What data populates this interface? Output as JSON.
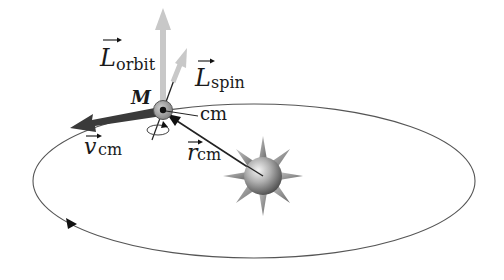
{
  "diagram": {
    "type": "orbital-mechanics-illustration",
    "labels": {
      "L_orbit": {
        "symbol": "L",
        "subscript": "orbit"
      },
      "L_spin": {
        "symbol": "L",
        "subscript": "spin"
      },
      "mass": "M",
      "center_of_mass": "cm",
      "v_cm": {
        "symbol": "v",
        "subscript": "cm"
      },
      "r_cm": {
        "symbol": "r",
        "subscript": "cm"
      }
    },
    "colors": {
      "orbit_line": "#555555",
      "angular_momentum_arrow": "#c8c8c8",
      "velocity_arrow": "#3a3a3a",
      "body_fill": "#9a9a9a",
      "star_fill": "#8c8c8c",
      "text": "#1a1a1a"
    },
    "orbit": {
      "shape": "ellipse",
      "cx": 254,
      "cy": 181,
      "rx": 221,
      "ry": 77,
      "direction": "counterclockwise"
    }
  }
}
